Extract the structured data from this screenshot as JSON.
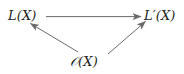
{
  "diagram": {
    "type": "commutative-triangle",
    "background_color": "#ffffff",
    "stroke_color": "#6b6b6b",
    "text_color": "#231f20",
    "nodes": [
      {
        "id": "L",
        "label": "L(X)",
        "position": "top-left",
        "x": 25,
        "y": 17
      },
      {
        "id": "Lprime",
        "label": "L′(X)",
        "position": "top-right",
        "x": 162,
        "y": 17
      },
      {
        "id": "O",
        "label": "𝒪(X)",
        "position": "bottom-center",
        "x": 92,
        "y": 62
      }
    ],
    "arrows": [
      {
        "id": "L-to-Lprime",
        "from": "L",
        "to": "Lprime",
        "style": "straight",
        "direction": "right",
        "label": ""
      },
      {
        "id": "O-to-L",
        "from": "O",
        "to": "L",
        "style": "straight",
        "direction": "up-left",
        "label": ""
      },
      {
        "id": "O-to-Lprime",
        "from": "O",
        "to": "Lprime",
        "style": "straight",
        "direction": "up-right",
        "label": ""
      }
    ]
  }
}
